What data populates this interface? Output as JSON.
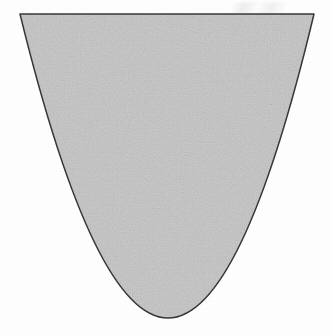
{
  "page": {
    "width": 332,
    "height": 335,
    "background_color": "#ffffff",
    "media_type": "scanned-book-page",
    "caption": ""
  },
  "figure": {
    "name": "shaded-parabolic-region",
    "fill_color": "#cdcdcd",
    "stroke_color": "#3a3a3a",
    "stroke_width": 1.5,
    "geometry": {
      "chord_left": {
        "x": 20,
        "y": 14
      },
      "chord_right": {
        "x": 314,
        "y": 14
      },
      "vertex": {
        "x": 168,
        "y": 318
      },
      "axis_of_symmetry_x": 168,
      "chord_width": 294,
      "depth": 304,
      "left_edge_samples": [
        {
          "y": 14,
          "x": 20
        },
        {
          "y": 60,
          "x": 31
        },
        {
          "y": 100,
          "x": 44
        },
        {
          "y": 140,
          "x": 57
        },
        {
          "y": 170,
          "x": 62
        },
        {
          "y": 200,
          "x": 75
        },
        {
          "y": 240,
          "x": 90
        },
        {
          "y": 280,
          "x": 110
        },
        {
          "y": 310,
          "x": 143
        },
        {
          "y": 318,
          "x": 168
        }
      ],
      "right_edge_samples": [
        {
          "y": 14,
          "x": 314
        },
        {
          "y": 60,
          "x": 306
        },
        {
          "y": 100,
          "x": 294
        },
        {
          "y": 140,
          "x": 281
        },
        {
          "y": 170,
          "x": 275
        },
        {
          "y": 200,
          "x": 262
        },
        {
          "y": 240,
          "x": 247
        },
        {
          "y": 280,
          "x": 226
        },
        {
          "y": 310,
          "x": 196
        },
        {
          "y": 318,
          "x": 168
        }
      ]
    }
  },
  "bleed_through": {
    "legible": false,
    "note": "Faint mirrored ghost text from the reverse side of the sheet; no characters are legible.",
    "ink_color": "#8f8f8f",
    "lines": [
      {
        "top": 30,
        "left": 44,
        "size": 14,
        "text": ""
      },
      {
        "top": 47,
        "left": 30,
        "size": 15,
        "text": ""
      },
      {
        "top": 68,
        "left": 56,
        "size": 13,
        "text": ""
      },
      {
        "top": 100,
        "left": 62,
        "size": 14,
        "text": ""
      },
      {
        "top": 122,
        "left": 86,
        "size": 13,
        "text": ""
      },
      {
        "top": 158,
        "left": 96,
        "size": 15,
        "text": ""
      },
      {
        "top": 182,
        "left": 110,
        "size": 13,
        "text": ""
      },
      {
        "top": 212,
        "left": 104,
        "size": 14,
        "text": ""
      },
      {
        "top": 238,
        "left": 122,
        "size": 13,
        "text": ""
      },
      {
        "top": 262,
        "left": 136,
        "size": 14,
        "text": ""
      }
    ]
  },
  "marks": {
    "corner_smudge": {
      "name": "top-right-ghost-mark",
      "visible": true
    }
  }
}
